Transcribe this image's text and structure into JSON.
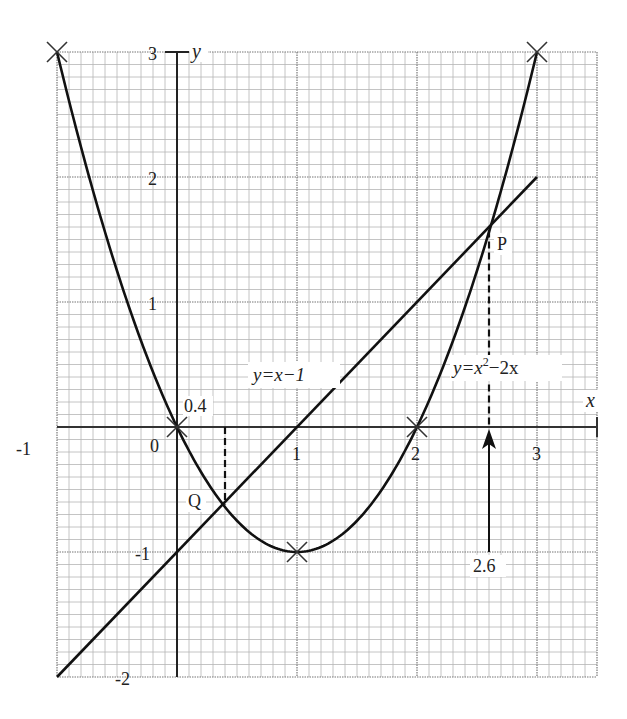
{
  "chart_data": {
    "type": "line",
    "title": "",
    "xlabel": "x",
    "ylabel": "y",
    "xlim": [
      -1,
      3.5
    ],
    "ylim": [
      -2,
      3
    ],
    "grid": true,
    "grid_minor_step": 0.1,
    "x_ticks": [
      "-1",
      "0",
      "1",
      "2",
      "3"
    ],
    "y_ticks": [
      "3",
      "2",
      "1",
      "-1",
      "-2"
    ],
    "series": [
      {
        "name": "y=x^2-2x",
        "label": "y=x",
        "label_sup": "2",
        "label_tail": "−2x",
        "function": "x^2 - 2x",
        "x": [
          -1,
          -0.5,
          0,
          0.5,
          1,
          1.5,
          2,
          2.5,
          3
        ],
        "values": [
          3,
          1.25,
          0,
          -0.75,
          -1,
          -0.75,
          0,
          1.25,
          3
        ],
        "marked_points": [
          [
            -1,
            3
          ],
          [
            0,
            0
          ],
          [
            1,
            -1
          ],
          [
            2,
            0
          ],
          [
            3,
            3
          ]
        ]
      },
      {
        "name": "y=x-1",
        "label": "y=x−1",
        "function": "x - 1",
        "x": [
          -1,
          3
        ],
        "values": [
          -2,
          2
        ]
      }
    ],
    "annotations": [
      {
        "text": "P",
        "x": 2.62,
        "y": 1.62,
        "note": "intersection point"
      },
      {
        "text": "Q",
        "x": 0.38,
        "y": -0.62,
        "note": "intersection point"
      },
      {
        "text": "0.4",
        "x": 0.4,
        "y": 0,
        "note": "dashed drop line from Q"
      },
      {
        "text": "2.6",
        "x": 2.6,
        "y": -1,
        "note": "arrow up to P with dashed line"
      },
      {
        "text": "0",
        "note": "origin label"
      }
    ]
  }
}
